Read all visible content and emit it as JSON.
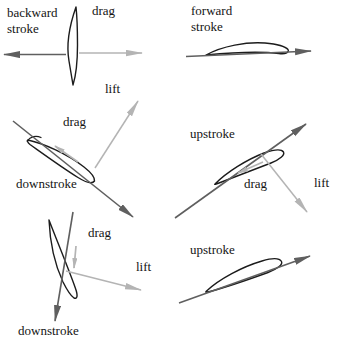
{
  "colors": {
    "background": "#ffffff",
    "text": "#141414",
    "airfoil_outline": "#1c1c1c",
    "dark_arrow": "#5f5f5f",
    "light_arrow": "#b4b4b4"
  },
  "panels": {
    "backward": {
      "stroke_label": "backward stroke",
      "drag_label": "drag"
    },
    "forward": {
      "stroke_label": "forward stroke"
    },
    "downstroke_mid": {
      "stroke_label": "downstroke",
      "drag_label": "drag",
      "lift_label": "lift"
    },
    "upstroke_mid": {
      "stroke_label": "upstroke",
      "drag_label": "drag",
      "lift_label": "lift"
    },
    "downstroke_bottom": {
      "stroke_label": "downstroke",
      "drag_label": "drag",
      "lift_label": "lift"
    },
    "upstroke_bottom": {
      "stroke_label": "upstroke"
    }
  }
}
